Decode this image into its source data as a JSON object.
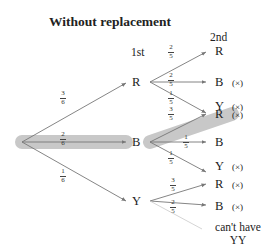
{
  "title": "Without replacement",
  "headers": {
    "first": "1st",
    "second": "2nd"
  },
  "colors": {
    "highlight": "#c8c8c8",
    "line": "#777777",
    "text": "#222222"
  },
  "first_level": {
    "R": {
      "label": "R",
      "prob": {
        "num": "3",
        "den": "6"
      }
    },
    "B": {
      "label": "B",
      "prob": {
        "num": "2",
        "den": "6"
      }
    },
    "Y": {
      "label": "Y",
      "prob": {
        "num": "1",
        "den": "6"
      }
    }
  },
  "second_level": {
    "R": [
      {
        "label": "R",
        "prob": {
          "num": "2",
          "den": "5"
        },
        "mark": ""
      },
      {
        "label": "B",
        "prob": {
          "num": "2",
          "den": "5"
        },
        "mark": "(×)"
      },
      {
        "label": "Y",
        "prob": {
          "num": "1",
          "den": "5"
        },
        "mark": "(×)"
      }
    ],
    "B": [
      {
        "label": "R",
        "prob": {
          "num": "3",
          "den": "5"
        },
        "mark": "(×)"
      },
      {
        "label": "B",
        "prob": {
          "num": "1",
          "den": "5"
        },
        "mark": ""
      },
      {
        "label": "Y",
        "prob": {
          "num": "1",
          "den": "5"
        },
        "mark": "(×)"
      }
    ],
    "Y": [
      {
        "label": "R",
        "prob": {
          "num": "3",
          "den": "5"
        },
        "mark": "(×)"
      },
      {
        "label": "B",
        "prob": {
          "num": "2",
          "den": "5"
        },
        "mark": "(×)"
      }
    ]
  },
  "note": {
    "line1": "can't have",
    "line2": "YY"
  },
  "highlighted_path": [
    "B",
    "R"
  ]
}
